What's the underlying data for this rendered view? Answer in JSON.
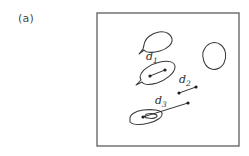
{
  "figure": {
    "panel_label": "(a)",
    "background_color": "#ffffff",
    "stroke_color": "#3a3a3a",
    "frame": {
      "name": "image-frame",
      "x": 97,
      "y": 13,
      "width": 142,
      "height": 133,
      "border_color": "#6a6a6a",
      "border_width": 1.4
    },
    "regions": [
      {
        "name": "blob-top-leaf",
        "description": "teardrop shaped outline, upper middle",
        "path": "M144,45 C145,38 152,33 159,32 C166,31 171,34 172,39 C173,44 167,49 160,51 C153,53 146,53 144,50 L139,54 L143,49 Z"
      },
      {
        "name": "blob-right-round",
        "description": "rounded closed contour, upper right",
        "path": "M205,48 C209,42 216,41 221,45 C226,49 227,57 224,63 C221,69 214,71 209,68 C204,65 202,57 203,52 Z"
      },
      {
        "name": "blob-d1-ellipse",
        "description": "tilted elongated outline containing displacement d1",
        "path": "M140,77 C141,70 151,64 160,62 C169,60 175,62 175,67 C175,73 166,80 157,83 C150,85 144,85 142,82 L136,85 L141,80 Z"
      },
      {
        "name": "blob-d3-ellipse",
        "description": "small elongated outline containing displacement d3",
        "path": "M130,120 C129,115 135,111 143,110 C152,109 161,110 162,113 C163,117 157,121 149,123 C141,125 133,125 130,122 Z M147,114 C152,113 156,114 156,116 C156,118 152,119 148,118 C145,118 144,115 147,114 Z"
      }
    ],
    "vectors": [
      {
        "name": "vector-d1",
        "label": "d",
        "subscript": "1",
        "label_x": 146,
        "label_y": 60,
        "from": {
          "x": 150,
          "y": 76
        },
        "to": {
          "x": 165,
          "y": 70
        },
        "dot_radius": 1.6
      },
      {
        "name": "vector-d2",
        "label": "d",
        "subscript": "2",
        "label_x": 179,
        "label_y": 83,
        "from": {
          "x": 179,
          "y": 93
        },
        "to": {
          "x": 196,
          "y": 87
        },
        "dot_radius": 1.6
      },
      {
        "name": "vector-d3",
        "label": "d",
        "subscript": "3",
        "label_x": 155,
        "label_y": 104,
        "from": {
          "x": 143,
          "y": 117
        },
        "to": {
          "x": 188,
          "y": 103
        },
        "dot_radius": 1.6
      }
    ]
  }
}
